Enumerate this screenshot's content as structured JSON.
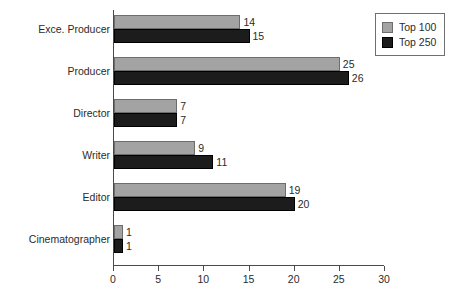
{
  "chart_data": {
    "type": "bar",
    "orientation": "horizontal",
    "title": "",
    "xlabel": "",
    "ylabel": "",
    "categories": [
      "Exce. Producer",
      "Producer",
      "Director",
      "Writer",
      "Editor",
      "Cinematographer"
    ],
    "series": [
      {
        "name": "Top 100",
        "color": "#a3a3a3",
        "values": [
          14,
          25,
          7,
          9,
          19,
          1
        ]
      },
      {
        "name": "Top 250",
        "color": "#1c1c1c",
        "values": [
          15,
          26,
          7,
          11,
          20,
          1
        ]
      }
    ],
    "xlim": [
      0,
      30
    ],
    "xticks": [
      0,
      5,
      10,
      15,
      20,
      25,
      30
    ],
    "xtick_labels": [
      "0",
      "5",
      "10",
      "15",
      "20",
      "25",
      "30"
    ],
    "grid": false,
    "legend_position": "top-right",
    "data_labels": true
  },
  "legend": {
    "entries": [
      {
        "label": "Top 100"
      },
      {
        "label": "Top 250"
      }
    ]
  }
}
